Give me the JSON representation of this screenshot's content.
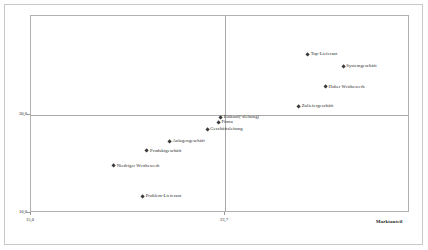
{
  "chart_data": {
    "type": "scatter",
    "title": "",
    "xlabel": "Marktanteil",
    "ylabel": "Marktausschöpfung",
    "xlim": [
      15.0,
      32.0
    ],
    "ylim": [
      10.0,
      50.0
    ],
    "grid": false,
    "legend": "none",
    "xticks": [
      "15,0",
      "23,7"
    ],
    "xtick_values": [
      15.0,
      23.7
    ],
    "yticks": [
      "30,0",
      "10,0"
    ],
    "ytick_values": [
      30.0,
      10.0
    ],
    "reference_lines": {
      "vertical_x": 23.7,
      "horizontal_y": 30.0
    },
    "points": [
      {
        "label": "Top-Lieferant",
        "x": 27.4,
        "y": 42.2
      },
      {
        "label": "Systemgeschäft",
        "x": 29.0,
        "y": 39.8
      },
      {
        "label": "Hoher Wettbewerb",
        "x": 28.2,
        "y": 35.6
      },
      {
        "label": "Zuliefergeschäft",
        "x": 27.0,
        "y": 31.6
      },
      {
        "label": "Einkauf(-sleitung)",
        "x": 23.5,
        "y": 29.4
      },
      {
        "label": "Firma",
        "x": 23.4,
        "y": 28.4
      },
      {
        "label": "Geschäftsleitung",
        "x": 22.9,
        "y": 27.0
      },
      {
        "label": "Anlagengeschäft",
        "x": 21.2,
        "y": 24.6
      },
      {
        "label": "Produktgeschäft",
        "x": 20.2,
        "y": 22.6
      },
      {
        "label": "Niedriger Wettbewerb",
        "x": 18.7,
        "y": 19.6
      },
      {
        "label": "Problem-Lieferant",
        "x": 20.0,
        "y": 13.4
      }
    ]
  }
}
